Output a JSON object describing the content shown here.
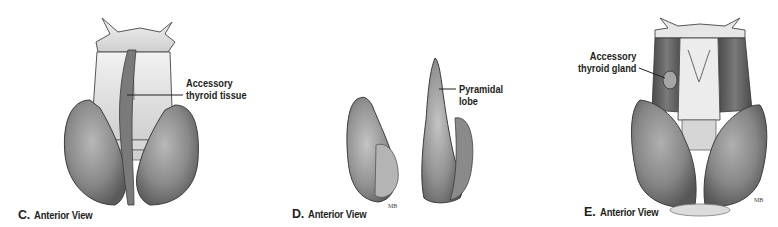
{
  "figure": {
    "panels": [
      {
        "id": "C",
        "letter": "C.",
        "caption": "Anterior View",
        "callouts": [
          {
            "line1": "Accessory",
            "line2": "thyroid tissue"
          }
        ]
      },
      {
        "id": "D",
        "letter": "D.",
        "caption": "Anterior View",
        "callouts": [
          {
            "line1": "Pyramidal",
            "line2": "lobe"
          }
        ]
      },
      {
        "id": "E",
        "letter": "E.",
        "caption": "Anterior View",
        "callouts": [
          {
            "line1": "Accessory",
            "line2": "thyroid gland"
          }
        ]
      }
    ],
    "colors": {
      "background": "#ffffff",
      "text": "#231f20",
      "gland_dark": "#6e6e6e",
      "gland_mid": "#9a9a9a",
      "cartilage": "#e4e4e4",
      "outline": "#3c3c3c"
    }
  }
}
